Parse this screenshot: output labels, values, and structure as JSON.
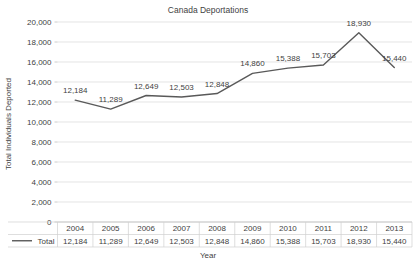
{
  "chart_data": {
    "type": "line",
    "title": "Canada Deportations",
    "xlabel": "Year",
    "ylabel": "Total Individuals Deported",
    "categories": [
      "2004",
      "2005",
      "2006",
      "2007",
      "2008",
      "2009",
      "2010",
      "2011",
      "2012",
      "2013"
    ],
    "series": [
      {
        "name": "Total",
        "values": [
          12184,
          11289,
          12649,
          12503,
          12848,
          14860,
          15388,
          15703,
          18930,
          15440
        ],
        "labels": [
          "12,184",
          "11,289",
          "12,649",
          "12,503",
          "12,848",
          "14,860",
          "15,388",
          "15,703",
          "18,930",
          "15,440"
        ],
        "color": "#595959"
      }
    ],
    "ylim": [
      0,
      20000
    ],
    "ytick_values": [
      0,
      2000,
      4000,
      6000,
      8000,
      10000,
      12000,
      14000,
      16000,
      18000,
      20000
    ],
    "ytick_labels": [
      "0",
      "2,000",
      "4,000",
      "6,000",
      "8,000",
      "10,000",
      "12,000",
      "14,000",
      "16,000",
      "18,000",
      "20,000"
    ],
    "grid": true,
    "legend_position": "data-table-left",
    "data_table": {
      "row_header": "Total",
      "columns": [
        "2004",
        "2005",
        "2006",
        "2007",
        "2008",
        "2009",
        "2010",
        "2011",
        "2012",
        "2013"
      ],
      "values": [
        "12,184",
        "11,289",
        "12,649",
        "12,503",
        "12,848",
        "14,860",
        "15,388",
        "15,703",
        "18,930",
        "15,440"
      ]
    }
  },
  "colors": {
    "series": "#595959",
    "grid": "#d9d9d9",
    "axis": "#bfbfbf",
    "text": "#3f3f3f",
    "table_border": "#d0d0d0",
    "background": "#ffffff"
  }
}
